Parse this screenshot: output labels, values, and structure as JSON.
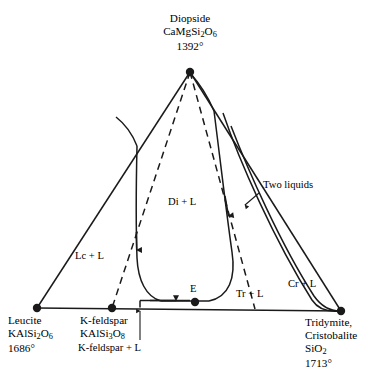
{
  "diagram": {
    "type": "ternary-phase-diagram",
    "ink_color": "#1a1a1a",
    "background": "#ffffff",
    "corners": {
      "top": {
        "name": "Diopside",
        "formula_parts": [
          {
            "t": "CaMgSi",
            "sub": false
          },
          {
            "t": "2",
            "sub": true
          },
          {
            "t": "O",
            "sub": false
          },
          {
            "t": "6",
            "sub": true
          }
        ],
        "formula_plain": "CaMgSi2O6",
        "temperature": "1392°",
        "x": 190,
        "y": 72
      },
      "bottom_left": {
        "name": "Leucite",
        "formula_parts": [
          {
            "t": "KAlSi",
            "sub": false
          },
          {
            "t": "2",
            "sub": true
          },
          {
            "t": "O",
            "sub": false
          },
          {
            "t": "6",
            "sub": true
          }
        ],
        "formula_plain": "KAlSi2O6",
        "temperature": "1686°",
        "x": 37,
        "y": 308
      },
      "bottom_right": {
        "name_line1": "Tridymite,",
        "name_line2": "Cristobalite",
        "formula_parts": [
          {
            "t": "SiO",
            "sub": false
          },
          {
            "t": "2",
            "sub": true
          }
        ],
        "formula_plain": "SiO2",
        "temperature": "1713°",
        "x": 341,
        "y": 311
      }
    },
    "binary_point": {
      "name": "K-feldspar",
      "formula_parts": [
        {
          "t": "KAlSi",
          "sub": false
        },
        {
          "t": "3",
          "sub": true
        },
        {
          "t": "O",
          "sub": false
        },
        {
          "t": "8",
          "sub": true
        }
      ],
      "formula_plain": "KAlSi3O8",
      "x": 112,
      "y": 308
    },
    "eutectic": {
      "label": "E",
      "x": 195,
      "y": 302
    },
    "field_labels": [
      {
        "id": "di-l",
        "text": "Di + L",
        "x": 168,
        "y": 203
      },
      {
        "id": "lc-l",
        "text": "Lc + L",
        "x": 75,
        "y": 257
      },
      {
        "id": "tr-l",
        "text": "Tr + L",
        "x": 236,
        "y": 295
      },
      {
        "id": "cr-l",
        "text": "Cr + L",
        "x": 288,
        "y": 285
      }
    ],
    "annotations": [
      {
        "id": "two-liquids",
        "text": "Two liquids",
        "x": 263,
        "y": 186
      },
      {
        "id": "k-feldspar-l",
        "text": "K-feldspar + L",
        "x": 110,
        "y": 349
      }
    ]
  }
}
